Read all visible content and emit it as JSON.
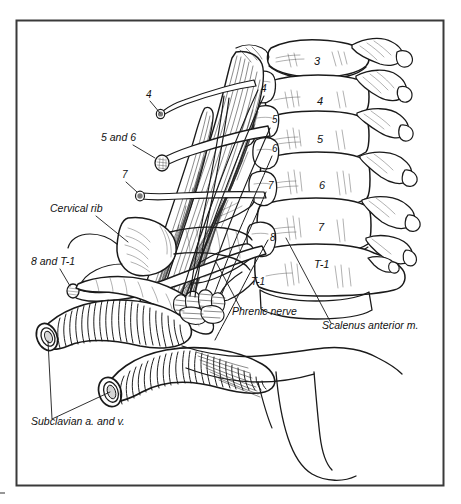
{
  "figure": {
    "domain": "anatomical-line-illustration",
    "frame": {
      "visible": true,
      "color": "#3a3a3a",
      "x": 16,
      "y": 20,
      "width": 427,
      "height": 465
    },
    "background_color": "#ffffff",
    "ink_color": "#1a1a1a"
  },
  "labels": {
    "nerve_roots_left": [
      {
        "id": "root-4",
        "text": "4",
        "x": 146,
        "y": 98
      },
      {
        "id": "root-5-and-6",
        "text": "5 and 6",
        "x": 101,
        "y": 141
      },
      {
        "id": "root-7",
        "text": "7",
        "x": 122,
        "y": 178
      },
      {
        "id": "root-8-and-t1",
        "text": "8 and T-1",
        "x": 31,
        "y": 265
      }
    ],
    "structures": [
      {
        "id": "cervical-rib",
        "text": "Cervical rib",
        "x": 50,
        "y": 212
      },
      {
        "id": "phrenic-nerve",
        "text": "Phrenic nerve",
        "x": 232,
        "y": 315
      },
      {
        "id": "scalenus-anterior",
        "text": "Scalenus anterior m.",
        "x": 322,
        "y": 329
      },
      {
        "id": "subclavian-vessels",
        "text": "Subclavian a. and v.",
        "x": 31,
        "y": 425
      }
    ],
    "vertebral_bodies": [
      {
        "id": "vertebra-3",
        "text": "3",
        "x": 314,
        "y": 65
      },
      {
        "id": "vertebra-4",
        "text": "4",
        "x": 317,
        "y": 105
      },
      {
        "id": "vertebra-5",
        "text": "5",
        "x": 317,
        "y": 143
      },
      {
        "id": "vertebra-6",
        "text": "6",
        "x": 319,
        "y": 189
      },
      {
        "id": "vertebra-7",
        "text": "7",
        "x": 318,
        "y": 231
      },
      {
        "id": "vertebra-t1",
        "text": "T-1",
        "x": 314,
        "y": 268
      }
    ],
    "foramina_roots": [
      {
        "id": "foramen-4",
        "text": "4",
        "x": 261,
        "y": 92
      },
      {
        "id": "foramen-5",
        "text": "5",
        "x": 272,
        "y": 123
      },
      {
        "id": "foramen-6",
        "text": "6",
        "x": 272,
        "y": 152
      },
      {
        "id": "foramen-7",
        "text": "7",
        "x": 268,
        "y": 189
      },
      {
        "id": "foramen-8",
        "text": "8",
        "x": 270,
        "y": 241
      },
      {
        "id": "process-t1",
        "text": "T-1",
        "x": 251,
        "y": 285
      }
    ]
  },
  "leader_lines": [
    {
      "id": "leader-root-4",
      "from": [
        150,
        101
      ],
      "to": [
        161,
        116
      ]
    },
    {
      "id": "leader-root-5-6",
      "from": [
        133,
        145
      ],
      "to": [
        156,
        157
      ]
    },
    {
      "id": "leader-root-7",
      "from": [
        126,
        182
      ],
      "to": [
        139,
        190
      ]
    },
    {
      "id": "leader-root-8-t1",
      "from": [
        60,
        269
      ],
      "to": [
        74,
        287
      ]
    },
    {
      "id": "leader-cervical-rib",
      "from": [
        96,
        216
      ],
      "to": [
        126,
        240
      ]
    },
    {
      "id": "leader-phrenic",
      "from": [
        241,
        309
      ],
      "to": [
        218,
        265
      ]
    },
    {
      "id": "leader-scalenus",
      "from": [
        330,
        323
      ],
      "to": [
        288,
        240
      ]
    },
    {
      "id": "leader-subclavian-a",
      "from": [
        52,
        419
      ],
      "to": [
        48,
        343
      ]
    },
    {
      "id": "leader-subclavian-v",
      "from": [
        52,
        419
      ],
      "to": [
        108,
        393
      ]
    }
  ],
  "anatomy": {
    "vertebrae_count": 6,
    "vertebrae_ids": [
      "C3",
      "C4",
      "C5",
      "C6",
      "C7",
      "T1"
    ],
    "rib_stumps_right": 7,
    "nerve_root_stumps_left": 4,
    "vessels": [
      "subclavian artery",
      "subclavian vein"
    ],
    "muscles": [
      "scalenus anterior"
    ],
    "nerves": [
      "phrenic nerve",
      "brachial plexus roots C4-T1"
    ]
  }
}
